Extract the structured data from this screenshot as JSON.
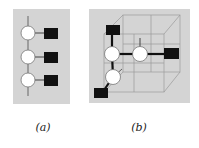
{
  "figure": {
    "panels": [
      {
        "id": "a",
        "caption": "(a)",
        "description": "linear chain of three white nodes each attached to a black square",
        "nodes": 3,
        "squares": 3
      },
      {
        "id": "b",
        "caption": "(b)",
        "description": "corner of a 3D cube lattice with three white nodes and three black squares",
        "nodes": 3,
        "squares": 3
      }
    ],
    "colors": {
      "panel_background": "#d4d4d4",
      "node_fill": "#ffffff",
      "square_fill": "#111111",
      "edge": "#111111",
      "cube_lines": "#9a9a9a"
    }
  }
}
